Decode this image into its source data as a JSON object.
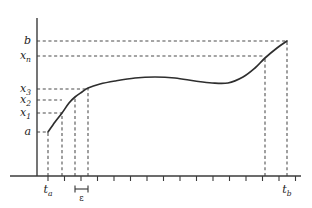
{
  "figure": {
    "title": "",
    "axis": {
      "y_axis_name": "vertical-axis",
      "x_axis_name": "horizontal-axis"
    },
    "y_labels": [
      {
        "id": "b",
        "base": "b",
        "sub": "",
        "y": 41
      },
      {
        "id": "xn",
        "base": "x",
        "sub": "n",
        "y": 56
      },
      {
        "id": "x3",
        "base": "x",
        "sub": "3",
        "y": 89
      },
      {
        "id": "x2",
        "base": "x",
        "sub": "2",
        "y": 100
      },
      {
        "id": "x1",
        "base": "x",
        "sub": "1",
        "y": 113
      },
      {
        "id": "a",
        "base": "a",
        "sub": "",
        "y": 132
      }
    ],
    "x_labels": [
      {
        "id": "ta",
        "base": "t",
        "sub": "a",
        "x": 48
      },
      {
        "id": "tb",
        "base": "t",
        "sub": "b",
        "x": 287
      }
    ],
    "epsilon": {
      "label": "ε",
      "x_start": 75,
      "x_end": 88
    },
    "guides": {
      "horizontal_y": [
        41,
        56,
        89,
        100,
        113,
        132
      ],
      "vertical_x": [
        48,
        62,
        75,
        88,
        265,
        287
      ]
    },
    "chart_data": {
      "type": "line",
      "title": "",
      "xlabel": "",
      "ylabel": "",
      "grid": false,
      "legend": false,
      "x_tick_count": 16,
      "annotations": [
        "a = curve value at t_a",
        "x_1, x_2, x_3 = successive approximations",
        "x_n = value near t_b",
        "b = upper bound",
        "epsilon = step width between subdivisions"
      ],
      "points": [
        {
          "x": 48,
          "y": 132
        },
        {
          "x": 55,
          "y": 122
        },
        {
          "x": 62,
          "y": 113
        },
        {
          "x": 69,
          "y": 103
        },
        {
          "x": 75,
          "y": 97
        },
        {
          "x": 82,
          "y": 92
        },
        {
          "x": 88,
          "y": 88
        },
        {
          "x": 100,
          "y": 84
        },
        {
          "x": 115,
          "y": 81
        },
        {
          "x": 135,
          "y": 78
        },
        {
          "x": 155,
          "y": 77
        },
        {
          "x": 175,
          "y": 78
        },
        {
          "x": 195,
          "y": 81
        },
        {
          "x": 212,
          "y": 83
        },
        {
          "x": 228,
          "y": 83
        },
        {
          "x": 243,
          "y": 77
        },
        {
          "x": 255,
          "y": 68
        },
        {
          "x": 265,
          "y": 58
        },
        {
          "x": 277,
          "y": 48
        },
        {
          "x": 287,
          "y": 41
        }
      ]
    }
  }
}
